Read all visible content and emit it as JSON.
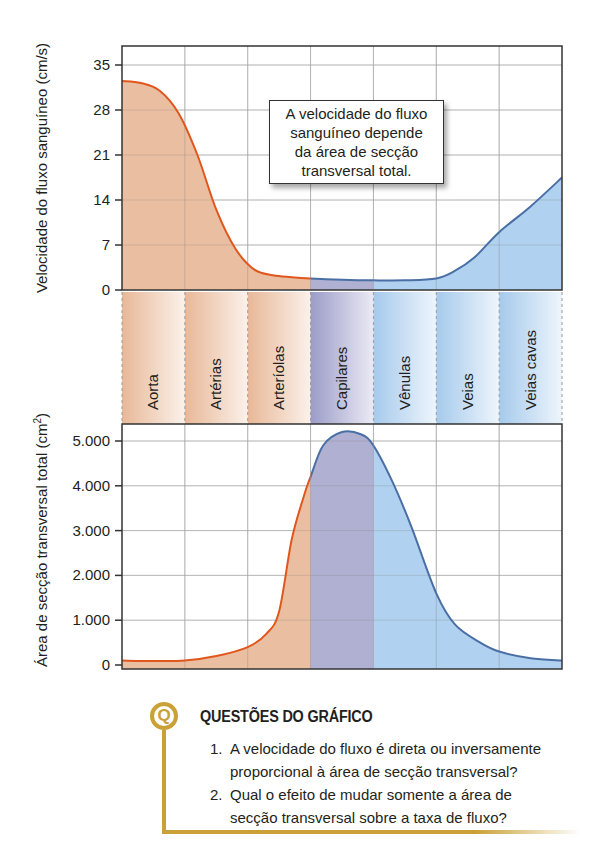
{
  "chart_data": [
    {
      "type": "area",
      "title": "",
      "ylabel": "Velocidade do fluxo sanguíneo (cm/s)",
      "xlabel": "",
      "ylim": [
        0,
        35
      ],
      "yticks": [
        "35",
        "28",
        "21",
        "14",
        "7",
        "0"
      ],
      "ytick_values": [
        35,
        28,
        21,
        14,
        7,
        0
      ],
      "categories": [
        "Aorta",
        "Artérias",
        "Arteríolas",
        "Capilares",
        "Vênulas",
        "Veias",
        "Veias cavas"
      ],
      "series": [
        {
          "name": "Velocidade",
          "x_positions": [
            0.0,
            0.3,
            0.6,
            0.9,
            1.2,
            1.5,
            1.8,
            2.1,
            2.4,
            2.7,
            3.0,
            3.5,
            4.0,
            4.5,
            5.0,
            5.3,
            5.6,
            6.0,
            6.5,
            7.0
          ],
          "values": [
            32.5,
            32.2,
            31,
            27.5,
            21,
            12.5,
            6.5,
            3.2,
            2.3,
            2.0,
            1.8,
            1.6,
            1.5,
            1.5,
            1.8,
            3.0,
            5.0,
            9.0,
            13.0,
            17.5
          ]
        }
      ],
      "grid": true
    },
    {
      "type": "area",
      "title": "",
      "ylabel": "Área de secção transversal total (cm²)",
      "xlabel": "",
      "ylim": [
        0,
        5500
      ],
      "yticks": [
        "5.000",
        "4.000",
        "3.000",
        "2.000",
        "1.000",
        "0"
      ],
      "ytick_values": [
        5000,
        4000,
        3000,
        2000,
        1000,
        0
      ],
      "categories": [
        "Aorta",
        "Artérias",
        "Arteríolas",
        "Capilares",
        "Vênulas",
        "Veias",
        "Veias cavas"
      ],
      "series": [
        {
          "name": "Área de secção transversal",
          "x_positions": [
            0.0,
            0.5,
            1.0,
            1.5,
            2.0,
            2.3,
            2.5,
            2.7,
            2.9,
            3.0,
            3.2,
            3.5,
            3.8,
            4.0,
            4.3,
            4.6,
            5.0,
            5.3,
            5.7,
            6.0,
            6.5,
            7.0
          ],
          "values": [
            100,
            90,
            100,
            200,
            400,
            700,
            1200,
            2800,
            3800,
            4200,
            4900,
            5200,
            5150,
            4900,
            4100,
            3100,
            1600,
            900,
            500,
            300,
            150,
            100
          ]
        }
      ],
      "grid": true
    }
  ],
  "annotation": {
    "lines": [
      "A velocidade do fluxo",
      "sanguíneo depende",
      "da área de secção",
      "transversal total."
    ]
  },
  "questions": {
    "badge": "Q",
    "title": "QUESTÕES DO GRÁFICO",
    "items": [
      {
        "num": "1.",
        "lines": [
          "A velocidade do fluxo é direta ou inversamente",
          "proporcional à área de secção transversal?"
        ]
      },
      {
        "num": "2.",
        "lines": [
          "Qual o efeito de mudar somente a área de",
          "secção transversal sobre a taxa de fluxo?"
        ]
      }
    ]
  },
  "colors": {
    "arterial_fill": "#e8b898",
    "arterial_line": "#e0571e",
    "capillary_fill": "#a9a9cf",
    "venous_fill": "#a9cdee",
    "venous_line": "#4a6fa5",
    "accent_gold": "#c9a136",
    "grid": "#c8c8c8",
    "axis": "#333333"
  }
}
